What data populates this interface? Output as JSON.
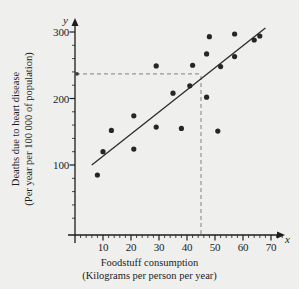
{
  "chart_data": {
    "type": "scatter",
    "title": "",
    "xlabel": "Foodstuff consumption (Kilograms per person per year)",
    "xlabel_line1": "Foodstuff consumption",
    "xlabel_line2": "(Kilograms per person per year)",
    "ylabel": "Deaths due to heart disease (Per year per 100 000 of population)",
    "ylabel_line1": "Deaths due to heart disease",
    "ylabel_line2": "(Per year per 100 000 of population)",
    "x_axis_symbol": "x",
    "y_axis_symbol": "y",
    "xlim": [
      0,
      75
    ],
    "ylim": [
      0,
      320
    ],
    "x_ticks": [
      10,
      20,
      30,
      40,
      50,
      60,
      70
    ],
    "y_ticks": [
      100,
      200,
      300
    ],
    "x_minor_tick_step": 2,
    "y_minor_tick_step": 20,
    "grid": false,
    "legend": null,
    "points": [
      {
        "x": 8,
        "y": 85
      },
      {
        "x": 10,
        "y": 120
      },
      {
        "x": 13,
        "y": 152
      },
      {
        "x": 21,
        "y": 124
      },
      {
        "x": 21,
        "y": 174
      },
      {
        "x": 29,
        "y": 157
      },
      {
        "x": 29,
        "y": 249
      },
      {
        "x": 35,
        "y": 208
      },
      {
        "x": 38,
        "y": 155
      },
      {
        "x": 41,
        "y": 219
      },
      {
        "x": 42,
        "y": 250
      },
      {
        "x": 47,
        "y": 202
      },
      {
        "x": 47,
        "y": 267
      },
      {
        "x": 48,
        "y": 293
      },
      {
        "x": 51,
        "y": 151
      },
      {
        "x": 52,
        "y": 248
      },
      {
        "x": 57,
        "y": 263
      },
      {
        "x": 57,
        "y": 297
      },
      {
        "x": 64,
        "y": 288
      },
      {
        "x": 66,
        "y": 294
      }
    ],
    "trend_line": {
      "label": "line of best fit",
      "x_start": 6,
      "y_start": 100,
      "x_end": 68,
      "y_end": 306
    },
    "guide_lines": {
      "style": "dashed",
      "vertical_x": 45,
      "horizontal_y": 237,
      "description": "dashed construction lines from x = 45 up to the line of best fit and across to the y-axis"
    }
  }
}
